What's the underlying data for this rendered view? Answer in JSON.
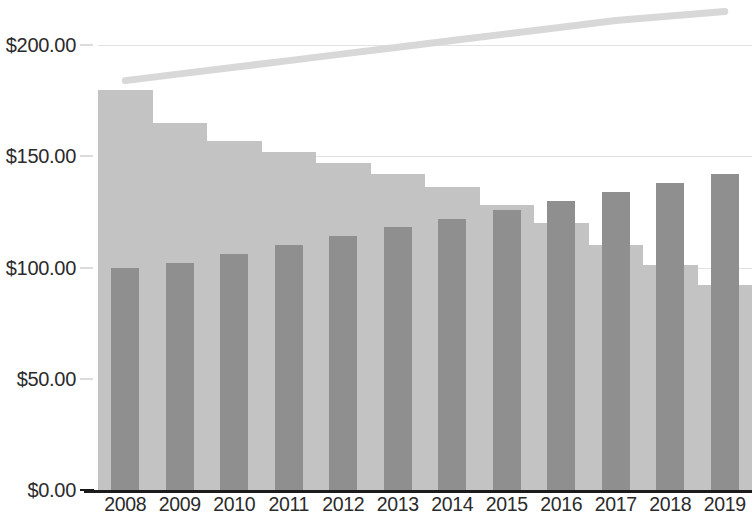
{
  "chart_data": {
    "type": "bar",
    "title": "",
    "subtitle": "",
    "xlabel": "",
    "ylabel": "",
    "categories": [
      "2008",
      "2009",
      "2010",
      "2011",
      "2012",
      "2013",
      "2014",
      "2015",
      "2016",
      "2017",
      "2018",
      "2019"
    ],
    "ylim": [
      0,
      200
    ],
    "y_ticks": [
      0,
      50,
      100,
      150,
      200
    ],
    "y_tick_labels": [
      "$0.00",
      "$50.00",
      "$100.00",
      "$150.00",
      "$200.00"
    ],
    "grid": true,
    "legend": "none",
    "series": [
      {
        "name": "light-bars",
        "type": "bar",
        "color": "#c3c3c3",
        "values": [
          180,
          165,
          157,
          152,
          147,
          142,
          136,
          128,
          120,
          110,
          101,
          92
        ]
      },
      {
        "name": "dark-bars",
        "type": "bar",
        "color": "#8f8f8f",
        "values": [
          100,
          102,
          106,
          110,
          114,
          118,
          122,
          126,
          130,
          134,
          138,
          142
        ]
      },
      {
        "name": "trend-line",
        "type": "line",
        "color": "#d8d8d8",
        "values": [
          184,
          187,
          190,
          193,
          196,
          199,
          202,
          205,
          208,
          211,
          213,
          215
        ]
      }
    ]
  },
  "axis": {
    "y_tick_labels": [
      "$0.00",
      "$50.00",
      "$100.00",
      "$150.00",
      "$200.00"
    ],
    "x_tick_labels": [
      "2008",
      "2009",
      "2010",
      "2011",
      "2012",
      "2013",
      "2014",
      "2015",
      "2016",
      "2017",
      "2018",
      "2019"
    ]
  },
  "colors": {
    "light_bar": "#c3c3c3",
    "dark_bar": "#8f8f8f",
    "trend_line": "#d8d8d8",
    "gridline": "#e2e2e2",
    "axis": "#1c1c1c",
    "text": "#2b2b2b",
    "background": "#ffffff"
  }
}
